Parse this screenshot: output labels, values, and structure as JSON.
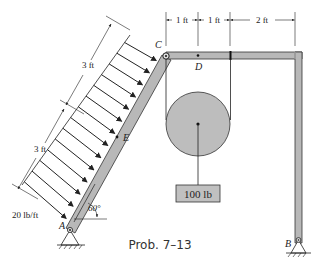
{
  "diagram": {
    "caption": "Prob. 7–13",
    "points": {
      "A": "A",
      "B": "B",
      "C": "C",
      "D": "D",
      "E": "E"
    },
    "dimensions": {
      "top_1": "1 ft",
      "top_2": "1 ft",
      "top_3": "2 ft",
      "left_upper": "3 ft",
      "left_lower": "3 ft"
    },
    "load_label": "20 lb/ft",
    "angle_label": "60°",
    "weight_label": "100 lb",
    "colors": {
      "member_fill": "#b8b8b8",
      "pulley_fill": "#bdbdbd",
      "weight_fill": "#c0c0c0",
      "line": "#222222"
    }
  }
}
